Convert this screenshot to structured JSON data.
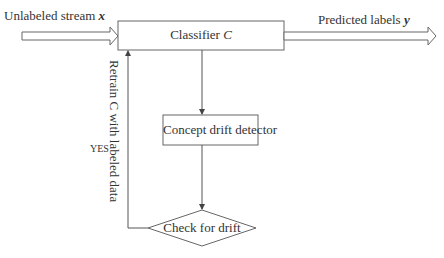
{
  "diagram": {
    "input_label": "Unlabeled stream",
    "input_var": "x",
    "output_label": "Predicted labels",
    "output_var": "y",
    "classifier_label": "Classifier",
    "classifier_var": "C",
    "detector_label": "Concept drift detector",
    "decision_label": "Check for drift",
    "feedback_label": "Retrain C with labeled data",
    "yes_label": "YES",
    "stroke_color": "#555555"
  }
}
